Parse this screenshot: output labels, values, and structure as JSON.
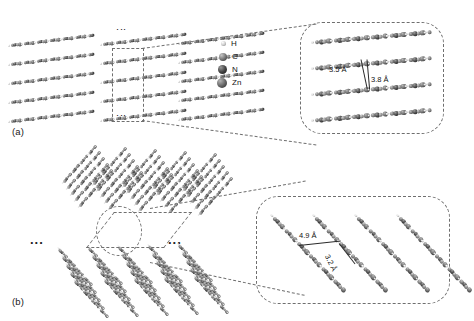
{
  "figure": {
    "panels": [
      {
        "id": "a",
        "label": "(a)",
        "ellipsis_top": "⋮",
        "ellipsis_bottom": "⋮",
        "inset": {
          "dimensions": [
            {
              "value": "3.5 Å",
              "name": "interlayer-distance-1"
            },
            {
              "value": "3.8 Å",
              "name": "interlayer-distance-2"
            }
          ],
          "chain_count": 4
        },
        "columns": 3,
        "rows_per_column": 5
      },
      {
        "id": "b",
        "label": "(b)",
        "ellipsis_left": "...",
        "ellipsis_right": "...",
        "inset": {
          "dimensions": [
            {
              "value": "4.9 Å",
              "name": "interchain-distance-1"
            },
            {
              "value": "3.2 Å",
              "name": "interchain-distance-2"
            }
          ],
          "chain_count": 4
        }
      }
    ],
    "legend": {
      "title": "atom-legend",
      "items": [
        {
          "symbol": "H",
          "name": "hydrogen",
          "color": "#c9c9c9",
          "size": 5
        },
        {
          "symbol": "C",
          "name": "carbon",
          "color": "#7a7a7a",
          "size": 8
        },
        {
          "symbol": "N",
          "name": "nitrogen",
          "color": "#454545",
          "size": 9
        },
        {
          "symbol": "Zn",
          "name": "zinc",
          "color": "#6a6a6a",
          "size": 10
        }
      ]
    },
    "colors": {
      "dash": "#6f6f6f",
      "text": "#111111",
      "background": "#ffffff"
    }
  }
}
